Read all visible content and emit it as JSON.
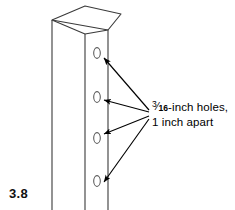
{
  "figure": {
    "label": "3.8"
  },
  "annotation": {
    "line1_prefix": "",
    "fraction_numerator": "3",
    "fraction_slash": "⁄",
    "fraction_denominator": "16",
    "line1_suffix": "-inch holes,",
    "line2": "1 inch apart",
    "full_text": "3/16-inch holes, 1 inch apart"
  },
  "post": {
    "description": "vertical square post drawn in perspective",
    "holes_count": 4,
    "hole_labels": [
      "hole-1",
      "hole-2",
      "hole-3",
      "hole-4"
    ]
  },
  "colors": {
    "background": "#ffffff",
    "outline": "#3a3a3a",
    "hole_outline": "#555555",
    "arrow": "#000000",
    "label_text": "#111111"
  }
}
